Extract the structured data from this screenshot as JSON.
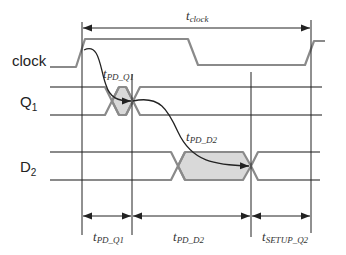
{
  "diagram": {
    "signals": [
      {
        "id": "clock",
        "label": "clock",
        "sub": ""
      },
      {
        "id": "q1",
        "label": "Q",
        "sub": "1"
      },
      {
        "id": "d2",
        "label": "D",
        "sub": "2"
      }
    ],
    "top_interval": {
      "label": "t",
      "sub": "clock"
    },
    "curve_labels": [
      {
        "id": "pd_q1",
        "label": "t",
        "sub": "PD_Q1"
      },
      {
        "id": "pd_d2",
        "label": "t",
        "sub": "PD_D2"
      }
    ],
    "bottom_intervals": [
      {
        "id": "pd_q1",
        "label": "t",
        "sub": "PD_Q1"
      },
      {
        "id": "pd_d2",
        "label": "t",
        "sub": "PD_D2"
      },
      {
        "id": "setup_q2",
        "label": "t",
        "sub": "SETUP_Q2"
      }
    ],
    "colors": {
      "waveform": "#8a8a8a",
      "shading": "#d9d9d9",
      "lines": "#222222"
    }
  }
}
